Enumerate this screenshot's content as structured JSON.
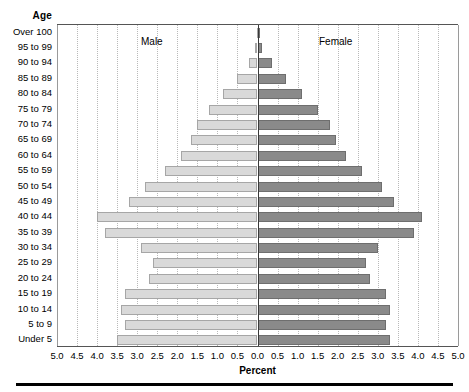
{
  "chart_data": {
    "type": "bar",
    "subtype": "population-pyramid",
    "title": "",
    "xlabel": "Percent",
    "ylabel": "Age",
    "categories": [
      "Over 100",
      "95 to 99",
      "90 to 94",
      "85 to 89",
      "80 to 84",
      "75 to 79",
      "70 to 74",
      "65 to 69",
      "60 to 64",
      "55 to 59",
      "50 to 54",
      "45 to 49",
      "40 to 44",
      "35 to 39",
      "30 to 34",
      "25 to 29",
      "20 to 24",
      "15 to 19",
      "10 to 14",
      "5 to 9",
      "Under 5"
    ],
    "series": [
      {
        "name": "Male",
        "color": "#d9d9d9",
        "side": "left",
        "values": [
          0.02,
          0.05,
          0.2,
          0.5,
          0.85,
          1.2,
          1.5,
          1.65,
          1.9,
          2.3,
          2.8,
          3.2,
          4.0,
          3.8,
          2.9,
          2.6,
          2.7,
          3.3,
          3.4,
          3.3,
          3.5
        ]
      },
      {
        "name": "Female",
        "color": "#8a8a8a",
        "side": "right",
        "values": [
          0.03,
          0.1,
          0.35,
          0.7,
          1.1,
          1.5,
          1.8,
          1.95,
          2.2,
          2.6,
          3.1,
          3.4,
          4.1,
          3.9,
          3.0,
          2.7,
          2.8,
          3.2,
          3.3,
          3.2,
          3.3
        ]
      }
    ],
    "xlim": [
      -5.0,
      5.0
    ],
    "xticks": [
      {
        "label": "5.0",
        "value": -5.0
      },
      {
        "label": "4.5",
        "value": -4.5
      },
      {
        "label": "4.0",
        "value": -4.0
      },
      {
        "label": "3.5",
        "value": -3.5
      },
      {
        "label": "3.0",
        "value": -3.0
      },
      {
        "label": "2.5",
        "value": -2.5
      },
      {
        "label": "2.0",
        "value": -2.0
      },
      {
        "label": "1.5",
        "value": -1.5
      },
      {
        "label": "1.0",
        "value": -1.0
      },
      {
        "label": "0.5",
        "value": -0.5
      },
      {
        "label": "0.0",
        "value": 0.0
      },
      {
        "label": "0.5",
        "value": 0.5
      },
      {
        "label": "1.0",
        "value": 1.0
      },
      {
        "label": "1.5",
        "value": 1.5
      },
      {
        "label": "2.0",
        "value": 2.0
      },
      {
        "label": "2.5",
        "value": 2.5
      },
      {
        "label": "3.0",
        "value": 3.0
      },
      {
        "label": "3.5",
        "value": 3.5
      },
      {
        "label": "4.0",
        "value": 4.0
      },
      {
        "label": "4.5",
        "value": 4.5
      },
      {
        "label": "5.0",
        "value": 5.0
      }
    ],
    "grid": true,
    "grid_style": "dotted-vertical",
    "legend": "in-plot-annotations",
    "annotations": [
      {
        "text": "Male",
        "side": "left"
      },
      {
        "text": "Female",
        "side": "right"
      }
    ]
  },
  "axis": {
    "age_header": "Age",
    "percent_title": "Percent"
  },
  "colors": {
    "male_bar": "#d9d9d9",
    "female_bar": "#8a8a8a",
    "zero_line": "#3a3a3a",
    "gridline": "#b9b9b9",
    "frame": "#555555",
    "footer_rule": "#000000"
  }
}
